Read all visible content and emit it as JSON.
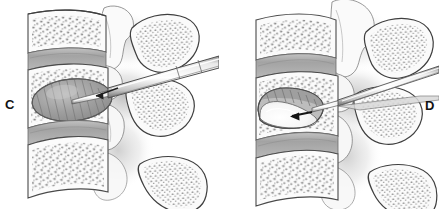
{
  "figure": {
    "background_color": "#ffffff",
    "width": 439,
    "height": 209,
    "style": "grayscale medical line illustration with stippled trabecular bone"
  },
  "panels": [
    {
      "id": "C",
      "label": "C",
      "caption": "Inflated balloon tamp creating cavity in vertebral body",
      "label_position": {
        "x": 5,
        "y": 98
      },
      "instrument": {
        "name": "balloon-tamp-cannula",
        "entry": "transpedicular, from posterior-superior right",
        "tip_reached": "anterior third of vertebral body"
      },
      "cavity": {
        "name": "balloon-cavity",
        "state": "inflated",
        "fill_color": "#a8a8a8"
      },
      "vertebrae_count": 3,
      "disc_count": 2,
      "spinous_process_count": 3
    },
    {
      "id": "D",
      "label": "D",
      "caption": "Polymethylmethacrylate cement injected into balloon cavity",
      "label_position": {
        "x": 425,
        "y": 99
      },
      "instrument": {
        "name": "cement-delivery-cannula",
        "entry": "transpedicular, from posterior-superior right",
        "tip_reached": "mid vertebral body at cavity"
      },
      "cavity": {
        "name": "cement-fill",
        "state": "filled-with-cement",
        "fill_color": "#f4f4f4"
      },
      "arrow": {
        "name": "cement-flow-arrow",
        "direction": "left",
        "color": "#1a1a1a"
      },
      "vertebrae_count": 3,
      "disc_count": 2,
      "spinous_process_count": 3
    }
  ],
  "colors": {
    "background": "#ffffff",
    "outline": "#3c3c3c",
    "cortical_bone": "#f7f7f7",
    "trabecular_stipple": "#8d8d8d",
    "disc": "#a9a9a9",
    "disc_shadow": "#8a8a8a",
    "cannula_body": "#d2d2d2",
    "cannula_edge": "#5a5a5a",
    "soft_tissue_shadow": "#c9c9c9",
    "balloon": "#a8a8a8",
    "cement": "#fbfbfb",
    "label_text": "#131313"
  }
}
